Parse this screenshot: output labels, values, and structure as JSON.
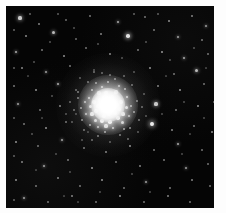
{
  "image": {
    "subject": "globular-star-cluster",
    "title": "Globular cluster",
    "alt_text": "Dense spherical globular star cluster with a saturated white core, resolved granular halo of stars, and a sparse surrounding field of stars on a black sky background",
    "frame": {
      "left": 6,
      "top": 6,
      "width": 208,
      "height": 202,
      "background_color": "#050505",
      "page_margin_color": "#fdfdfd"
    },
    "palette": {
      "sky": "#050505",
      "star": "#ffffff",
      "core": "#ffffff",
      "halo": "#c8c8c8",
      "page": "#fdfdfd"
    },
    "cluster": {
      "center_x": 102,
      "center_y": 99,
      "core_radius": 17,
      "inner_halo_radius": 30,
      "outer_halo_radius": 52
    }
  },
  "stars": {
    "core_cloud": [
      [
        99,
        92,
        2.6,
        1.0
      ],
      [
        104,
        95,
        2.4,
        1.0
      ],
      [
        95,
        97,
        2.3,
        0.98
      ],
      [
        108,
        98,
        2.5,
        1.0
      ],
      [
        101,
        101,
        2.7,
        1.0
      ],
      [
        97,
        104,
        2.4,
        1.0
      ],
      [
        106,
        103,
        2.2,
        0.99
      ],
      [
        111,
        99,
        2.1,
        0.96
      ],
      [
        92,
        100,
        2.0,
        0.94
      ],
      [
        103,
        108,
        2.4,
        1.0
      ],
      [
        98,
        110,
        2.2,
        0.97
      ],
      [
        109,
        107,
        2.0,
        0.95
      ],
      [
        94,
        94,
        1.9,
        0.92
      ],
      [
        113,
        103,
        1.9,
        0.9
      ],
      [
        90,
        105,
        1.8,
        0.88
      ],
      [
        106,
        91,
        1.9,
        0.91
      ],
      [
        100,
        87,
        1.8,
        0.88
      ],
      [
        115,
        96,
        1.7,
        0.85
      ],
      [
        88,
        96,
        1.7,
        0.84
      ],
      [
        96,
        115,
        1.9,
        0.89
      ],
      [
        104,
        116,
        1.8,
        0.87
      ],
      [
        112,
        112,
        1.8,
        0.86
      ],
      [
        86,
        108,
        1.6,
        0.8
      ],
      [
        117,
        108,
        1.6,
        0.8
      ],
      [
        93,
        87,
        1.6,
        0.78
      ],
      [
        110,
        86,
        1.6,
        0.79
      ],
      [
        120,
        101,
        1.5,
        0.76
      ],
      [
        84,
        100,
        1.5,
        0.75
      ],
      [
        100,
        120,
        1.6,
        0.78
      ],
      [
        89,
        114,
        1.5,
        0.74
      ],
      [
        116,
        116,
        1.5,
        0.74
      ],
      [
        83,
        92,
        1.4,
        0.7
      ],
      [
        121,
        91,
        1.4,
        0.7
      ],
      [
        107,
        122,
        1.4,
        0.7
      ],
      [
        92,
        121,
        1.4,
        0.68
      ],
      [
        123,
        110,
        1.3,
        0.66
      ],
      [
        80,
        108,
        1.3,
        0.65
      ],
      [
        96,
        81,
        1.4,
        0.69
      ],
      [
        113,
        80,
        1.3,
        0.64
      ],
      [
        79,
        96,
        1.3,
        0.63
      ],
      [
        125,
        100,
        1.2,
        0.6
      ],
      [
        86,
        84,
        1.2,
        0.6
      ],
      [
        119,
        83,
        1.2,
        0.6
      ],
      [
        84,
        119,
        1.2,
        0.58
      ],
      [
        118,
        123,
        1.2,
        0.58
      ],
      [
        102,
        76,
        1.2,
        0.58
      ],
      [
        99,
        126,
        1.2,
        0.57
      ],
      [
        75,
        102,
        1.1,
        0.54
      ],
      [
        128,
        106,
        1.1,
        0.54
      ],
      [
        90,
        77,
        1.1,
        0.52
      ],
      [
        124,
        122,
        1.1,
        0.52
      ],
      [
        76,
        114,
        1.1,
        0.51
      ],
      [
        131,
        95,
        1.0,
        0.48
      ],
      [
        72,
        92,
        1.0,
        0.47
      ],
      [
        109,
        73,
        1.0,
        0.48
      ],
      [
        92,
        130,
        1.0,
        0.46
      ],
      [
        114,
        129,
        1.0,
        0.46
      ],
      [
        78,
        124,
        0.9,
        0.42
      ],
      [
        133,
        114,
        0.9,
        0.42
      ],
      [
        82,
        76,
        0.9,
        0.42
      ],
      [
        126,
        79,
        0.9,
        0.41
      ],
      [
        68,
        104,
        0.9,
        0.4
      ],
      [
        104,
        69,
        0.9,
        0.4
      ],
      [
        136,
        101,
        0.8,
        0.36
      ],
      [
        70,
        84,
        0.8,
        0.36
      ],
      [
        86,
        134,
        0.8,
        0.36
      ],
      [
        122,
        133,
        0.8,
        0.36
      ],
      [
        64,
        96,
        0.8,
        0.34
      ],
      [
        96,
        67,
        0.8,
        0.34
      ],
      [
        118,
        70,
        0.8,
        0.34
      ],
      [
        138,
        88,
        0.7,
        0.3
      ],
      [
        66,
        116,
        0.7,
        0.3
      ],
      [
        104,
        136,
        0.7,
        0.3
      ],
      [
        132,
        126,
        0.7,
        0.3
      ],
      [
        74,
        72,
        0.7,
        0.3
      ],
      [
        60,
        108,
        0.7,
        0.28
      ],
      [
        140,
        110,
        0.7,
        0.28
      ],
      [
        88,
        64,
        0.7,
        0.28
      ],
      [
        128,
        66,
        0.7,
        0.28
      ],
      [
        76,
        134,
        0.7,
        0.28
      ]
    ],
    "field": [
      [
        14,
        12,
        1.6,
        0.78
      ],
      [
        33,
        18,
        1.1,
        0.5
      ],
      [
        60,
        14,
        0.9,
        0.4
      ],
      [
        84,
        10,
        1.0,
        0.46
      ],
      [
        112,
        16,
        1.4,
        0.66
      ],
      [
        139,
        11,
        1.0,
        0.45
      ],
      [
        163,
        15,
        1.2,
        0.55
      ],
      [
        186,
        10,
        1.1,
        0.5
      ],
      [
        200,
        20,
        1.3,
        0.6
      ],
      [
        20,
        30,
        1.2,
        0.54
      ],
      [
        47,
        26,
        1.5,
        0.72
      ],
      [
        70,
        33,
        0.9,
        0.4
      ],
      [
        95,
        28,
        1.1,
        0.5
      ],
      [
        122,
        30,
        1.8,
        0.88
      ],
      [
        148,
        24,
        1.0,
        0.45
      ],
      [
        172,
        31,
        1.3,
        0.62
      ],
      [
        196,
        34,
        1.0,
        0.45
      ],
      [
        10,
        46,
        1.4,
        0.68
      ],
      [
        36,
        44,
        1.0,
        0.46
      ],
      [
        58,
        50,
        1.2,
        0.56
      ],
      [
        80,
        42,
        1.0,
        0.44
      ],
      [
        104,
        48,
        1.1,
        0.52
      ],
      [
        132,
        44,
        1.0,
        0.45
      ],
      [
        156,
        46,
        1.2,
        0.58
      ],
      [
        178,
        52,
        1.4,
        0.66
      ],
      [
        202,
        48,
        1.0,
        0.44
      ],
      [
        16,
        62,
        1.1,
        0.52
      ],
      [
        40,
        66,
        1.3,
        0.62
      ],
      [
        64,
        60,
        1.0,
        0.46
      ],
      [
        88,
        66,
        0.9,
        0.4
      ],
      [
        144,
        62,
        1.2,
        0.56
      ],
      [
        168,
        68,
        1.0,
        0.45
      ],
      [
        190,
        64,
        1.5,
        0.72
      ],
      [
        8,
        80,
        1.0,
        0.45
      ],
      [
        30,
        84,
        1.2,
        0.56
      ],
      [
        52,
        78,
        1.4,
        0.68
      ],
      [
        72,
        86,
        1.0,
        0.46
      ],
      [
        152,
        80,
        1.1,
        0.5
      ],
      [
        174,
        84,
        1.2,
        0.56
      ],
      [
        198,
        78,
        1.0,
        0.44
      ],
      [
        12,
        98,
        1.3,
        0.62
      ],
      [
        34,
        104,
        1.0,
        0.44
      ],
      [
        54,
        100,
        1.1,
        0.5
      ],
      [
        150,
        98,
        1.6,
        0.78
      ],
      [
        170,
        104,
        1.0,
        0.46
      ],
      [
        192,
        100,
        1.2,
        0.56
      ],
      [
        208,
        96,
        0.9,
        0.4
      ],
      [
        18,
        118,
        1.0,
        0.46
      ],
      [
        40,
        122,
        1.2,
        0.56
      ],
      [
        60,
        116,
        1.0,
        0.44
      ],
      [
        146,
        118,
        1.9,
        0.92
      ],
      [
        166,
        124,
        1.1,
        0.52
      ],
      [
        188,
        120,
        1.0,
        0.45
      ],
      [
        206,
        126,
        1.2,
        0.55
      ],
      [
        10,
        136,
        1.2,
        0.56
      ],
      [
        32,
        140,
        1.0,
        0.44
      ],
      [
        56,
        134,
        1.3,
        0.62
      ],
      [
        78,
        142,
        1.0,
        0.46
      ],
      [
        100,
        146,
        1.1,
        0.5
      ],
      [
        124,
        140,
        1.2,
        0.56
      ],
      [
        148,
        144,
        1.0,
        0.45
      ],
      [
        172,
        138,
        1.4,
        0.66
      ],
      [
        196,
        144,
        1.0,
        0.44
      ],
      [
        16,
        156,
        1.1,
        0.5
      ],
      [
        38,
        160,
        1.3,
        0.62
      ],
      [
        62,
        154,
        1.0,
        0.45
      ],
      [
        86,
        162,
        1.2,
        0.56
      ],
      [
        110,
        156,
        1.0,
        0.44
      ],
      [
        134,
        160,
        1.1,
        0.5
      ],
      [
        158,
        154,
        1.0,
        0.46
      ],
      [
        180,
        162,
        1.3,
        0.6
      ],
      [
        202,
        158,
        1.0,
        0.44
      ],
      [
        10,
        174,
        1.2,
        0.55
      ],
      [
        30,
        180,
        1.0,
        0.44
      ],
      [
        52,
        172,
        1.1,
        0.5
      ],
      [
        74,
        180,
        1.0,
        0.45
      ],
      [
        96,
        174,
        1.2,
        0.56
      ],
      [
        118,
        182,
        1.0,
        0.44
      ],
      [
        140,
        176,
        1.3,
        0.62
      ],
      [
        164,
        182,
        1.0,
        0.46
      ],
      [
        186,
        174,
        1.1,
        0.5
      ],
      [
        204,
        180,
        1.0,
        0.44
      ],
      [
        18,
        192,
        1.3,
        0.62
      ],
      [
        42,
        196,
        1.0,
        0.44
      ],
      [
        66,
        190,
        1.1,
        0.5
      ],
      [
        90,
        196,
        1.0,
        0.45
      ],
      [
        114,
        190,
        1.2,
        0.55
      ],
      [
        138,
        196,
        1.0,
        0.44
      ],
      [
        162,
        190,
        1.1,
        0.5
      ],
      [
        184,
        196,
        1.0,
        0.45
      ],
      [
        24,
        8,
        0.8,
        0.34
      ],
      [
        52,
        8,
        0.8,
        0.32
      ],
      [
        128,
        8,
        0.8,
        0.34
      ],
      [
        152,
        8,
        0.8,
        0.32
      ],
      [
        210,
        8,
        0.8,
        0.32
      ],
      [
        8,
        24,
        0.8,
        0.34
      ],
      [
        8,
        62,
        0.8,
        0.32
      ],
      [
        8,
        112,
        0.8,
        0.32
      ],
      [
        8,
        150,
        0.8,
        0.32
      ],
      [
        8,
        194,
        0.8,
        0.34
      ],
      [
        210,
        40,
        0.8,
        0.32
      ],
      [
        210,
        72,
        0.8,
        0.32
      ],
      [
        210,
        140,
        0.8,
        0.32
      ],
      [
        210,
        170,
        0.8,
        0.32
      ],
      [
        210,
        198,
        0.8,
        0.32
      ],
      [
        44,
        36,
        0.7,
        0.28
      ],
      [
        68,
        22,
        0.7,
        0.28
      ],
      [
        92,
        38,
        0.7,
        0.28
      ],
      [
        116,
        52,
        0.7,
        0.28
      ],
      [
        140,
        36,
        0.7,
        0.28
      ],
      [
        164,
        54,
        0.7,
        0.28
      ],
      [
        188,
        42,
        0.7,
        0.28
      ],
      [
        28,
        56,
        0.7,
        0.28
      ],
      [
        46,
        90,
        0.7,
        0.28
      ],
      [
        26,
        128,
        0.7,
        0.28
      ],
      [
        70,
        108,
        0.7,
        0.26
      ],
      [
        50,
        148,
        0.7,
        0.26
      ],
      [
        94,
        186,
        0.7,
        0.26
      ],
      [
        126,
        168,
        0.7,
        0.26
      ],
      [
        156,
        108,
        0.7,
        0.26
      ],
      [
        178,
        96,
        0.7,
        0.26
      ],
      [
        198,
        112,
        0.7,
        0.26
      ],
      [
        144,
        186,
        0.7,
        0.26
      ],
      [
        176,
        148,
        0.7,
        0.26
      ],
      [
        64,
        166,
        0.7,
        0.26
      ],
      [
        22,
        70,
        0.6,
        0.22
      ],
      [
        36,
        112,
        0.6,
        0.22
      ],
      [
        58,
        190,
        0.6,
        0.22
      ],
      [
        82,
        126,
        0.6,
        0.22
      ],
      [
        106,
        108,
        0.6,
        0.22
      ],
      [
        160,
        70,
        0.6,
        0.22
      ],
      [
        184,
        128,
        0.6,
        0.22
      ],
      [
        200,
        62,
        0.6,
        0.22
      ],
      [
        30,
        164,
        0.6,
        0.22
      ],
      [
        72,
        196,
        0.6,
        0.22
      ]
    ]
  }
}
